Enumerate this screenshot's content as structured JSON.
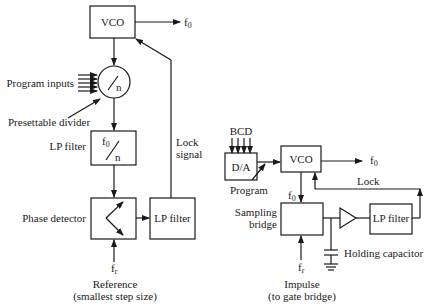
{
  "left_diagram": {
    "vco": {
      "label": "VCO"
    },
    "output": {
      "label": "f",
      "subscript": "0"
    },
    "program_inputs": {
      "label": "Program inputs"
    },
    "divider": {
      "symbol": "n",
      "label": "Presettable divider"
    },
    "lp_filter_1": {
      "label": "LP filter",
      "numerator": "f",
      "numerator_sub": "0",
      "denominator": "n"
    },
    "lock_signal": {
      "line1": "Lock",
      "line2": "signal"
    },
    "phase_detector": {
      "label": "Phase detector"
    },
    "lp_filter_2": {
      "label": "LP filter"
    },
    "reference_input": {
      "label": "f",
      "subscript": "r"
    },
    "reference_caption": {
      "line1": "Reference",
      "line2": "(smallest step size)"
    }
  },
  "right_diagram": {
    "bcd": {
      "label": "BCD"
    },
    "da": {
      "label": "D/A"
    },
    "program": {
      "label": "Program"
    },
    "vco": {
      "label": "VCO"
    },
    "output": {
      "label": "f",
      "subscript": "0"
    },
    "feedback_f0": {
      "label": "f",
      "subscript": "0"
    },
    "lock": {
      "label": "Lock"
    },
    "sampling_bridge": {
      "line1": "Sampling",
      "line2": "bridge"
    },
    "lp_filter": {
      "label": "LP filter"
    },
    "holding_capacitor": {
      "label": "Holding capacitor"
    },
    "impulse_input": {
      "label": "f",
      "subscript": "r"
    },
    "impulse_caption": {
      "line1": "Impulse",
      "line2": "(to gate bridge)"
    }
  }
}
